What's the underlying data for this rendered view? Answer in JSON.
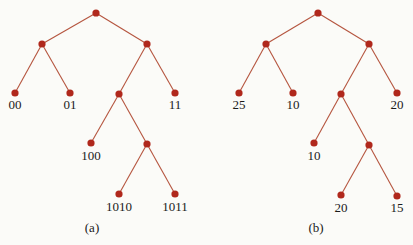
{
  "diagram": {
    "colors": {
      "edge": "#b5553f",
      "node": "#b0281c",
      "text": "#1a1a1a",
      "background": "#fbfbf8"
    },
    "trees": [
      {
        "caption": "(a)",
        "leaf_labels": [
          "00",
          "01",
          "11",
          "100",
          "1010",
          "1011"
        ]
      },
      {
        "caption": "(b)",
        "leaf_labels": [
          "25",
          "10",
          "20",
          "10",
          "20",
          "15"
        ]
      }
    ]
  }
}
